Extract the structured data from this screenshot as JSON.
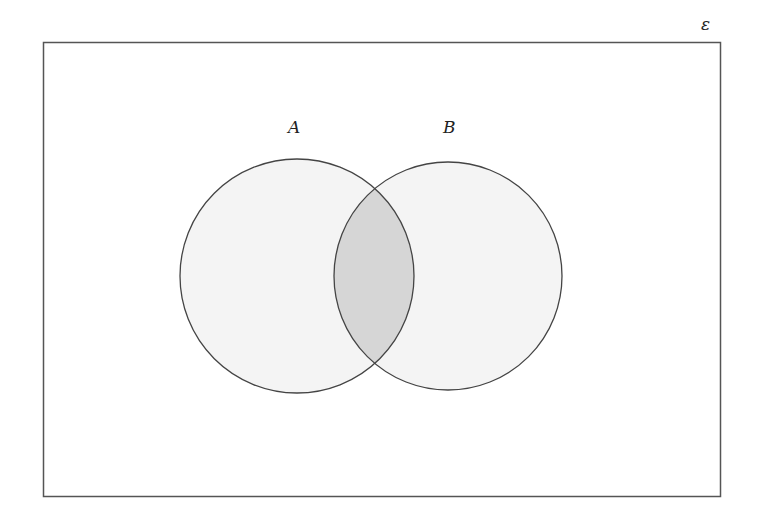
{
  "diagram": {
    "type": "venn",
    "universal_set_label": "ε",
    "sets": [
      {
        "label": "A",
        "cx": 297,
        "cy": 276,
        "r": 117
      },
      {
        "label": "B",
        "cx": 448,
        "cy": 276,
        "r": 114
      }
    ],
    "shaded_region": "A ∩ B",
    "colors": {
      "outline": "#444444",
      "set_fill": "#f4f4f4",
      "intersection_fill": "#d6d6d6",
      "background": "#ffffff"
    },
    "frame": {
      "x": 43,
      "y": 42,
      "width": 677,
      "height": 454
    }
  }
}
